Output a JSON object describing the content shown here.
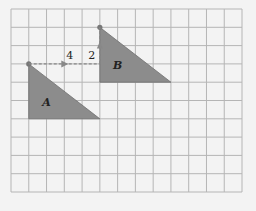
{
  "diagram": {
    "grid": {
      "cols": 13,
      "rows": 10,
      "left": 11,
      "top": 9,
      "cell_w": 17.77,
      "cell_h": 18.3,
      "line_color": "#b5b5b5"
    },
    "shape_fill": "#8c8c8c",
    "shape_stroke": "#6e6e6e",
    "triangles": [
      {
        "label": "A",
        "vertices": [
          [
            1,
            3
          ],
          [
            1,
            6
          ],
          [
            5,
            6
          ]
        ],
        "label_pos": [
          2,
          5.3
        ]
      },
      {
        "label": "B",
        "vertices": [
          [
            5,
            1
          ],
          [
            5,
            4
          ],
          [
            9,
            4
          ]
        ],
        "label_pos": [
          6,
          3.3
        ]
      }
    ],
    "arrows": [
      {
        "label": "4",
        "from": [
          1,
          3
        ],
        "to": [
          5,
          3
        ],
        "style": "dashed",
        "label_pos": [
          3.3,
          2.75
        ]
      },
      {
        "label": "2",
        "from": [
          5,
          3
        ],
        "to": [
          5,
          1
        ],
        "style": "dashed",
        "label_pos": [
          4.55,
          2.75
        ]
      }
    ]
  }
}
